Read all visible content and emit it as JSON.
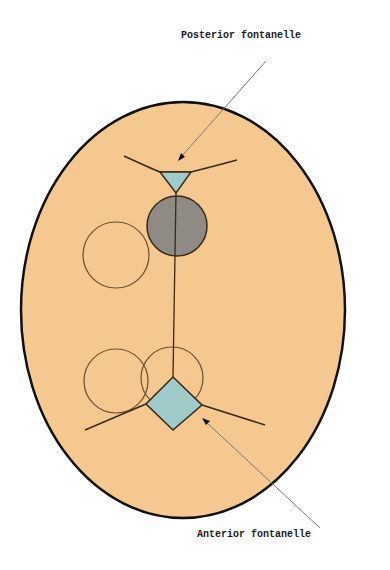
{
  "diagram": {
    "type": "anatomical skull top-view diagram",
    "labels": {
      "posterior": "Posterior fontanelle",
      "anterior": "Anterior fontanelle"
    },
    "colors": {
      "skull_fill": "#f4c88e",
      "skull_stroke": "#111111",
      "fontanelle_fill": "#9fcbcb",
      "occipital_circle_fill": "#8f8a84",
      "suture_stroke": "#3a2a18",
      "pointer_stroke": "#7a7a7a"
    },
    "shapes": [
      {
        "name": "skull-outline",
        "kind": "ellipse",
        "cx": 183,
        "cy": 310,
        "rx": 162,
        "ry": 208
      },
      {
        "name": "posterior-fontanelle",
        "kind": "triangle",
        "points": [
          [
            160,
            172
          ],
          [
            191,
            172
          ],
          [
            176,
            193
          ]
        ]
      },
      {
        "name": "occipital-circle",
        "kind": "circle",
        "cx": 177,
        "cy": 226,
        "r": 30
      },
      {
        "name": "parietal-circle-left",
        "kind": "circle",
        "cx": 116,
        "cy": 255,
        "r": 33
      },
      {
        "name": "frontal-circle-left",
        "kind": "circle",
        "cx": 116,
        "cy": 381,
        "r": 32
      },
      {
        "name": "frontal-circle-right",
        "kind": "circle",
        "cx": 172,
        "cy": 378,
        "r": 31
      },
      {
        "name": "anterior-fontanelle",
        "kind": "diamond",
        "points": [
          [
            173,
            377
          ],
          [
            202,
            405
          ],
          [
            173,
            430
          ],
          [
            146,
            404
          ]
        ]
      }
    ]
  }
}
